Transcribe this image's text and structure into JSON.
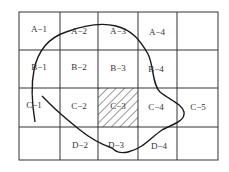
{
  "diagram": {
    "type": "grid-with-boundary",
    "rows": [
      "A",
      "B",
      "C",
      "D"
    ],
    "columns": 5,
    "grid_x": [
      19,
      60,
      98,
      138,
      177,
      218
    ],
    "grid_y": [
      12,
      50,
      88,
      127,
      160
    ],
    "colors": {
      "line": "#333333",
      "text": "#333333",
      "hatch": "#333333",
      "background": "#ffffff"
    },
    "cells": [
      {
        "id": "a1",
        "label": "A−1",
        "x": 39,
        "y": 30
      },
      {
        "id": "a2",
        "label": "A−2",
        "x": 79,
        "y": 32
      },
      {
        "id": "a3",
        "label": "A−3",
        "x": 118,
        "y": 32
      },
      {
        "id": "a4",
        "label": "A−4",
        "x": 157,
        "y": 33
      },
      {
        "id": "a5",
        "label": "",
        "x": 197,
        "y": 31
      },
      {
        "id": "b1",
        "label": "B−1",
        "x": 39,
        "y": 68
      },
      {
        "id": "b2",
        "label": "B−2",
        "x": 79,
        "y": 68
      },
      {
        "id": "b3",
        "label": "B−3",
        "x": 118,
        "y": 69
      },
      {
        "id": "b4",
        "label": "B−4",
        "x": 156,
        "y": 70
      },
      {
        "id": "b5",
        "label": "",
        "x": 197,
        "y": 69
      },
      {
        "id": "c1",
        "label": "C−1",
        "x": 34,
        "y": 106
      },
      {
        "id": "c2",
        "label": "C−2",
        "x": 79,
        "y": 107
      },
      {
        "id": "c3",
        "label": "C−3",
        "x": 118,
        "y": 107,
        "hatched": true
      },
      {
        "id": "c4",
        "label": "C−4",
        "x": 156,
        "y": 108
      },
      {
        "id": "c5",
        "label": "C−5",
        "x": 198,
        "y": 108
      },
      {
        "id": "d1",
        "label": "",
        "x": 39,
        "y": 144
      },
      {
        "id": "d2",
        "label": "D−2",
        "x": 80,
        "y": 146
      },
      {
        "id": "d3",
        "label": "D−3",
        "x": 116,
        "y": 146
      },
      {
        "id": "d4",
        "label": "D−4",
        "x": 159,
        "y": 147
      },
      {
        "id": "d5",
        "label": "",
        "x": 197,
        "y": 144
      }
    ]
  }
}
